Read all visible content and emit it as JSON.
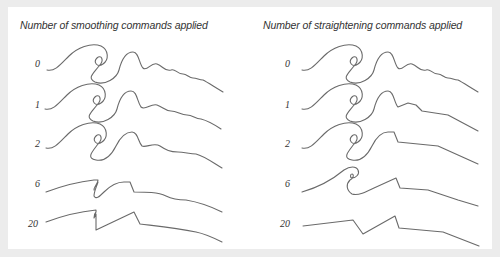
{
  "figure": {
    "left_panel": {
      "title": "Number of smoothing commands applied",
      "rows": [
        {
          "label": "0"
        },
        {
          "label": "1"
        },
        {
          "label": "2"
        },
        {
          "label": "6"
        },
        {
          "label": "20"
        }
      ]
    },
    "right_panel": {
      "title": "Number of straightening commands applied",
      "rows": [
        {
          "label": "0"
        },
        {
          "label": "1"
        },
        {
          "label": "2"
        },
        {
          "label": "6"
        },
        {
          "label": "20"
        }
      ]
    },
    "colors": {
      "background": "#ececec",
      "panel": "#ffffff",
      "stroke": "#6a6a6a",
      "text": "#333333"
    }
  }
}
